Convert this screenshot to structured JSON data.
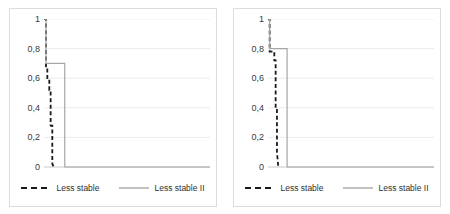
{
  "figure": {
    "background": "#ffffff",
    "panel_border_color": "#dcdcdc",
    "gridline_color": "#e6e6e6",
    "axis_color": "#c8c8c8",
    "dashed_color": "#1a1a1a",
    "solid_color": "#a6a6a6",
    "tick_text_color": "#3b3b3b",
    "legend_text_color": "#2f2f2f"
  },
  "legend": {
    "dashed_label": "Less stable",
    "solid_label": "Less stable II",
    "dashed_swatch_name": "dashed-line-swatch",
    "solid_swatch_name": "solid-line-swatch"
  },
  "chart_data": [
    {
      "type": "line",
      "title": "",
      "subtitle": "",
      "xlabel": "",
      "ylabel": "",
      "panel": "left",
      "grid": true,
      "grid_axis": "y",
      "legend_position": "bottom",
      "ylim": [
        0,
        1
      ],
      "yticks": [
        0,
        0.2,
        0.4,
        0.6,
        0.8,
        1
      ],
      "ytick_labels": [
        "0",
        "0,2",
        "0,4",
        "0,6",
        "0,8",
        "1"
      ],
      "xlim": [
        0,
        100
      ],
      "xticks": [],
      "xtick_labels": [],
      "series": [
        {
          "name": "Less stable",
          "style": "dashed",
          "color": "#1a1a1a",
          "x": [
            0,
            1.2,
            1.2,
            2.0,
            2.0,
            3.2,
            3.2,
            4.0,
            4.0,
            5.0,
            5.0,
            6.0
          ],
          "y": [
            1,
            1,
            0.66,
            0.66,
            0.6,
            0.6,
            0.52,
            0.52,
            0.28,
            0.28,
            0.02,
            0
          ]
        },
        {
          "name": "Less stable II",
          "style": "solid",
          "color": "#a6a6a6",
          "x": [
            0,
            1.2,
            1.2,
            12.5,
            12.5,
            100
          ],
          "y": [
            1,
            1,
            0.7,
            0.7,
            0,
            0
          ]
        }
      ]
    },
    {
      "type": "line",
      "title": "",
      "subtitle": "",
      "xlabel": "",
      "ylabel": "",
      "panel": "right",
      "grid": true,
      "grid_axis": "y",
      "legend_position": "bottom",
      "ylim": [
        0,
        1
      ],
      "yticks": [
        0,
        0.2,
        0.4,
        0.6,
        0.8,
        1
      ],
      "ytick_labels": [
        "0",
        "0,2",
        "0,4",
        "0,6",
        "0,8",
        "1"
      ],
      "xlim": [
        0,
        100
      ],
      "xticks": [],
      "xtick_labels": [],
      "series": [
        {
          "name": "Less stable",
          "style": "dashed",
          "color": "#1a1a1a",
          "x": [
            0,
            1.0,
            1.0,
            3.8,
            3.8,
            4.6,
            4.6,
            5.4,
            5.4,
            6.2
          ],
          "y": [
            1,
            1,
            0.78,
            0.78,
            0.72,
            0.72,
            0.4,
            0.4,
            0.1,
            0
          ]
        },
        {
          "name": "Less stable II",
          "style": "solid",
          "color": "#a6a6a6",
          "x": [
            0,
            1.0,
            1.0,
            11.5,
            11.5,
            100
          ],
          "y": [
            1,
            1,
            0.8,
            0.8,
            0,
            0
          ]
        }
      ]
    }
  ]
}
